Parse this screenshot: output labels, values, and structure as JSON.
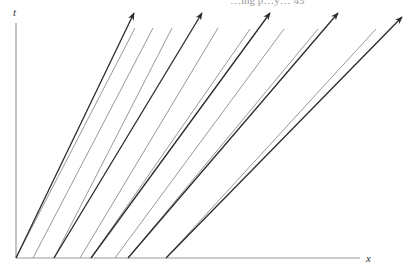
{
  "figure": {
    "type": "spacetime-diagram",
    "axes": {
      "vertical_label": "t",
      "horizontal_label": "x"
    },
    "top_cut_text": "…ing p…y…               45",
    "origin_px": [
      16,
      258
    ],
    "worldlines": [
      {
        "from": [
          16,
          258
        ],
        "to": [
          134,
          13
        ]
      },
      {
        "from": [
          54,
          258
        ],
        "to": [
          202,
          13
        ]
      },
      {
        "from": [
          91,
          258
        ],
        "to": [
          270,
          13
        ]
      },
      {
        "from": [
          128,
          258
        ],
        "to": [
          338,
          13
        ]
      },
      {
        "from": [
          166,
          258
        ],
        "to": [
          402,
          17
        ]
      }
    ],
    "signals": [
      {
        "from": [
          16,
          258
        ],
        "to": [
          135,
          28
        ]
      },
      {
        "from": [
          33,
          258
        ],
        "to": [
          153,
          28
        ]
      },
      {
        "from": [
          54,
          258
        ],
        "to": [
          172,
          28
        ]
      },
      {
        "from": [
          80,
          258
        ],
        "to": [
          218,
          28
        ]
      },
      {
        "from": [
          91,
          258
        ],
        "to": [
          250,
          29
        ]
      },
      {
        "from": [
          115,
          258
        ],
        "to": [
          284,
          29
        ]
      },
      {
        "from": [
          128,
          258
        ],
        "to": [
          318,
          29
        ]
      },
      {
        "from": [
          166,
          258
        ],
        "to": [
          376,
          29
        ]
      }
    ],
    "colors": {
      "worldline": "#2a2a2a",
      "signal": "#8c8c8c",
      "axis": "#9a9a9a"
    }
  }
}
